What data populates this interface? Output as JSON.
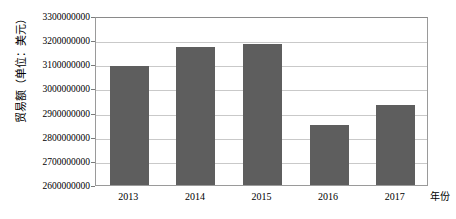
{
  "chart_data": {
    "type": "bar",
    "title": "",
    "subtitle": "",
    "xlabel": "年份",
    "ylabel": "贸易额（单位：美元）",
    "categories": [
      "2013",
      "2014",
      "2015",
      "2016",
      "2017"
    ],
    "values": [
      3095000000,
      3170000000,
      3185000000,
      2850000000,
      2930000000
    ],
    "ylim": [
      2600000000,
      3300000000
    ],
    "ytick_step": 100000000,
    "ytick_labels": [
      "3300000000",
      "3200000000",
      "3100000000",
      "3000000000",
      "2900000000",
      "2800000000",
      "2700000000",
      "2600000000"
    ],
    "ytick_values": [
      3300000000,
      3200000000,
      3100000000,
      3000000000,
      2900000000,
      2800000000,
      2700000000,
      2600000000
    ],
    "grid": true,
    "grid_axis": "y",
    "legend": false,
    "legend_position": "none",
    "series": [
      {
        "name": "贸易额",
        "values": [
          3095000000,
          3170000000,
          3185000000,
          2850000000,
          2930000000
        ]
      }
    ],
    "colors": {
      "bar_fill": "#5e5e5e",
      "gridline": "#c9c9c9",
      "axis_border": "#9a9a9a",
      "text": "#000000",
      "background": "#ffffff"
    }
  }
}
